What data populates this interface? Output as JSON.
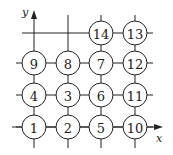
{
  "diagram": {
    "axes": {
      "x_label": "x",
      "y_label": "y"
    },
    "grid": {
      "columns_x": [
        34,
        68,
        101,
        135
      ],
      "rows_y": [
        127,
        95,
        63,
        33
      ],
      "radius": 12
    },
    "nodes": [
      {
        "label": "1",
        "col": 0,
        "row": 0
      },
      {
        "label": "2",
        "col": 1,
        "row": 0
      },
      {
        "label": "5",
        "col": 2,
        "row": 0
      },
      {
        "label": "10",
        "col": 3,
        "row": 0
      },
      {
        "label": "4",
        "col": 0,
        "row": 1
      },
      {
        "label": "3",
        "col": 1,
        "row": 1
      },
      {
        "label": "6",
        "col": 2,
        "row": 1
      },
      {
        "label": "11",
        "col": 3,
        "row": 1
      },
      {
        "label": "9",
        "col": 0,
        "row": 2
      },
      {
        "label": "8",
        "col": 1,
        "row": 2
      },
      {
        "label": "7",
        "col": 2,
        "row": 2
      },
      {
        "label": "12",
        "col": 3,
        "row": 2
      },
      {
        "label": "14",
        "col": 2,
        "row": 3
      },
      {
        "label": "13",
        "col": 3,
        "row": 3
      }
    ]
  }
}
